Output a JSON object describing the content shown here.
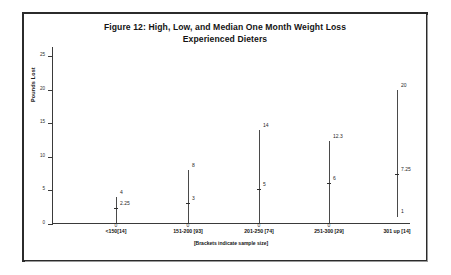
{
  "figure": {
    "title_line1": "Figure 12: High, Low, and Median One Month Weight Loss",
    "title_line2": "Experienced Dieters",
    "footnote": "[Brackets indicate sample size]"
  },
  "chart_data": {
    "type": "line",
    "title": "Figure 12: High, Low, and Median One Month Weight Loss Experienced Dieters",
    "subtitle": "Experienced Dieters",
    "xlabel": "[Brackets indicate sample size]",
    "ylabel": "Pounds Lost",
    "ylim": [
      0,
      25
    ],
    "yticks": [
      0,
      5,
      10,
      15,
      20,
      25
    ],
    "ytick_labels": [
      "0",
      "5",
      "10",
      "15",
      "20",
      "25"
    ],
    "grid": false,
    "legend": "none",
    "categories": [
      "<150[14]",
      "151-200 [93]",
      "201-250 [74]",
      "251-300 [29]",
      "301 up [14]"
    ],
    "sample_sizes": [
      14,
      93,
      74,
      29,
      14
    ],
    "series": [
      {
        "name": "High",
        "values": [
          4,
          8,
          14,
          12.3,
          20
        ]
      },
      {
        "name": "Median",
        "values": [
          2.25,
          3,
          5,
          6,
          7.25
        ]
      },
      {
        "name": "Low",
        "values": [
          0,
          0,
          0,
          0,
          1
        ]
      }
    ],
    "point_labels": {
      "high": [
        "4",
        "8",
        "14",
        "12.3",
        "20"
      ],
      "median": [
        "2.25",
        "3",
        "5",
        "6",
        "7.25"
      ],
      "low": [
        "0",
        "0",
        "0",
        "0",
        "1"
      ]
    },
    "colors": {
      "stem": "#4a4a4a",
      "axis": "#3a3a3a",
      "text": "#1f1f1f",
      "frame": "#2b2b2b",
      "background": "#ffffff"
    }
  }
}
